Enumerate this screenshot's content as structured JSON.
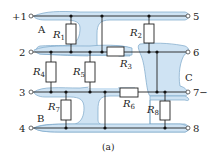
{
  "diagram": {
    "caption": "(a)",
    "colors": {
      "region_fill": "#cfe3f3",
      "region_stroke": "#7aa6c8",
      "wire": "#222222",
      "resistor_fill": "#ffffff"
    },
    "terminals": {
      "left": [
        {
          "id": "t1",
          "label": "+1"
        },
        {
          "id": "t2",
          "label": "2"
        },
        {
          "id": "t3",
          "label": "3"
        },
        {
          "id": "t4",
          "label": "4"
        }
      ],
      "right": [
        {
          "id": "t5",
          "label": "5"
        },
        {
          "id": "t6",
          "label": "6"
        },
        {
          "id": "t7",
          "label": "7−"
        },
        {
          "id": "t8",
          "label": "8"
        }
      ]
    },
    "regions": [
      {
        "id": "A",
        "label": "A"
      },
      {
        "id": "B",
        "label": "B"
      },
      {
        "id": "C",
        "label": "C"
      }
    ],
    "resistors": [
      {
        "id": "R1",
        "name": "R",
        "sub": "1"
      },
      {
        "id": "R2",
        "name": "R",
        "sub": "2"
      },
      {
        "id": "R3",
        "name": "R",
        "sub": "3"
      },
      {
        "id": "R4",
        "name": "R",
        "sub": "4"
      },
      {
        "id": "R5",
        "name": "R",
        "sub": "5"
      },
      {
        "id": "R6",
        "name": "R",
        "sub": "6"
      },
      {
        "id": "R7",
        "name": "R",
        "sub": "7"
      },
      {
        "id": "R8",
        "name": "R",
        "sub": "8"
      }
    ]
  }
}
